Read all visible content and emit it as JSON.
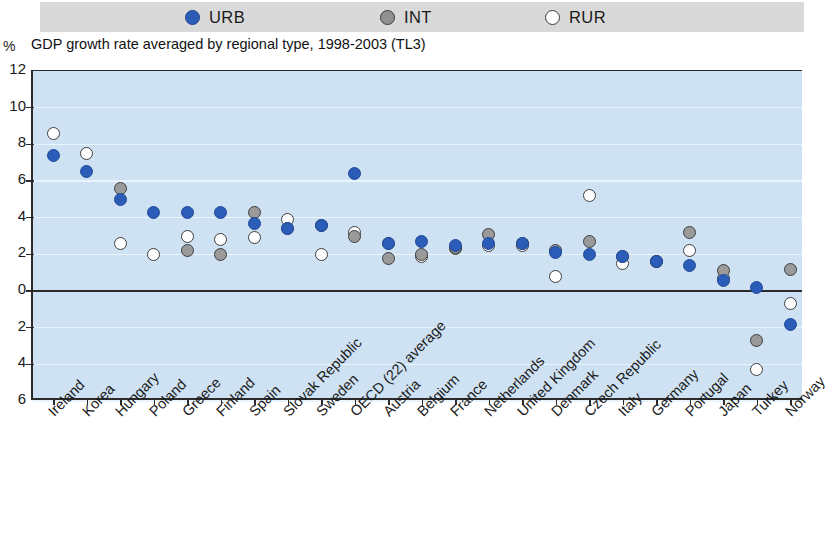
{
  "legend": {
    "items": [
      {
        "key": "urb",
        "label": "URB",
        "color": "#2b5cb8",
        "style": "filled-blue"
      },
      {
        "key": "int",
        "label": "INT",
        "color": "#919191",
        "style": "filled-grey"
      },
      {
        "key": "rur",
        "label": "RUR",
        "color": "#ffffff",
        "style": "open-white"
      }
    ]
  },
  "axis": {
    "unit_label": "%",
    "y_tick_labels": [
      "12",
      "10",
      "8",
      "6",
      "4",
      "2",
      "0",
      "2",
      "4",
      "6"
    ]
  },
  "chart_data": {
    "type": "scatter",
    "title": "GDP growth rate averaged by regional type, 1998-2003 (TL3)",
    "xlabel": "",
    "ylabel": "%",
    "ylim": [
      -6,
      12
    ],
    "yticks": [
      12,
      10,
      8,
      6,
      4,
      2,
      0,
      -2,
      -4,
      -6
    ],
    "ytick_labels": [
      "12",
      "10",
      "8",
      "6",
      "4",
      "2",
      "0",
      "2",
      "4",
      "6"
    ],
    "grid": true,
    "legend_position": "top",
    "note": "Negative y-axis tick labels are printed without a minus sign in the source figure.",
    "categories": [
      "Ireland",
      "Korea",
      "Hungary",
      "Poland",
      "Greece",
      "Finland",
      "Spain",
      "Slovak Republic",
      "Sweden",
      "OECD (22) average",
      "Austria",
      "Belgium",
      "France",
      "Netherlands",
      "United Kingdom",
      "Denmark",
      "Czech Republic",
      "Italy",
      "Germany",
      "Portugal",
      "Japan",
      "Turkey",
      "Norway"
    ],
    "series": [
      {
        "name": "URB",
        "color": "#2b5cb8",
        "values": [
          7.4,
          6.5,
          5.0,
          4.3,
          4.3,
          4.3,
          3.7,
          3.4,
          3.6,
          6.4,
          2.6,
          2.7,
          2.5,
          2.6,
          2.6,
          2.1,
          2.0,
          1.9,
          1.6,
          1.4,
          0.6,
          0.2,
          -1.8
        ]
      },
      {
        "name": "INT",
        "color": "#919191",
        "values": [
          null,
          null,
          5.6,
          null,
          2.2,
          2.0,
          4.3,
          3.4,
          3.6,
          3.0,
          1.8,
          2.0,
          2.4,
          3.1,
          2.6,
          2.2,
          2.7,
          1.9,
          1.6,
          3.2,
          1.1,
          -2.7,
          1.2
        ]
      },
      {
        "name": "RUR",
        "color": "#ffffff",
        "values": [
          8.6,
          7.5,
          2.6,
          2.0,
          3.0,
          2.8,
          2.9,
          3.9,
          2.0,
          3.2,
          2.6,
          1.9,
          2.3,
          2.5,
          2.5,
          0.8,
          5.2,
          1.5,
          1.6,
          2.2,
          0.7,
          -4.3,
          -0.7
        ]
      }
    ]
  }
}
